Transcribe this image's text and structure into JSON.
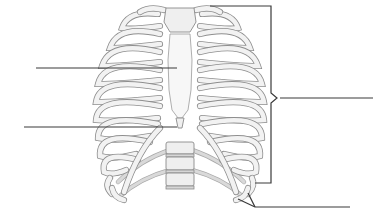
{
  "diagram": {
    "style": "grayscale anatomical illustration",
    "colors": {
      "background": "#ffffff",
      "bone_fill": "#efefef",
      "bone_outline": "#8a8a8a",
      "leader_line": "#3a3a3a"
    },
    "structures": [
      "sternum",
      "ribs",
      "costal cartilages",
      "xiphoid process",
      "thoracic vertebrae"
    ],
    "labels": [
      {
        "id": "label-1",
        "text": "",
        "side": "left",
        "line_y": 68,
        "points_to": "body of sternum"
      },
      {
        "id": "label-2",
        "text": "",
        "side": "left",
        "line_y": 127,
        "points_to": "xiphoid process"
      },
      {
        "id": "label-3",
        "text": "",
        "side": "right",
        "line_y": 98,
        "points_to": "ribs (bracketed group)"
      },
      {
        "id": "label-4",
        "text": "",
        "side": "right",
        "line_y": 207,
        "points_to": "lower / floating ribs"
      }
    ]
  }
}
